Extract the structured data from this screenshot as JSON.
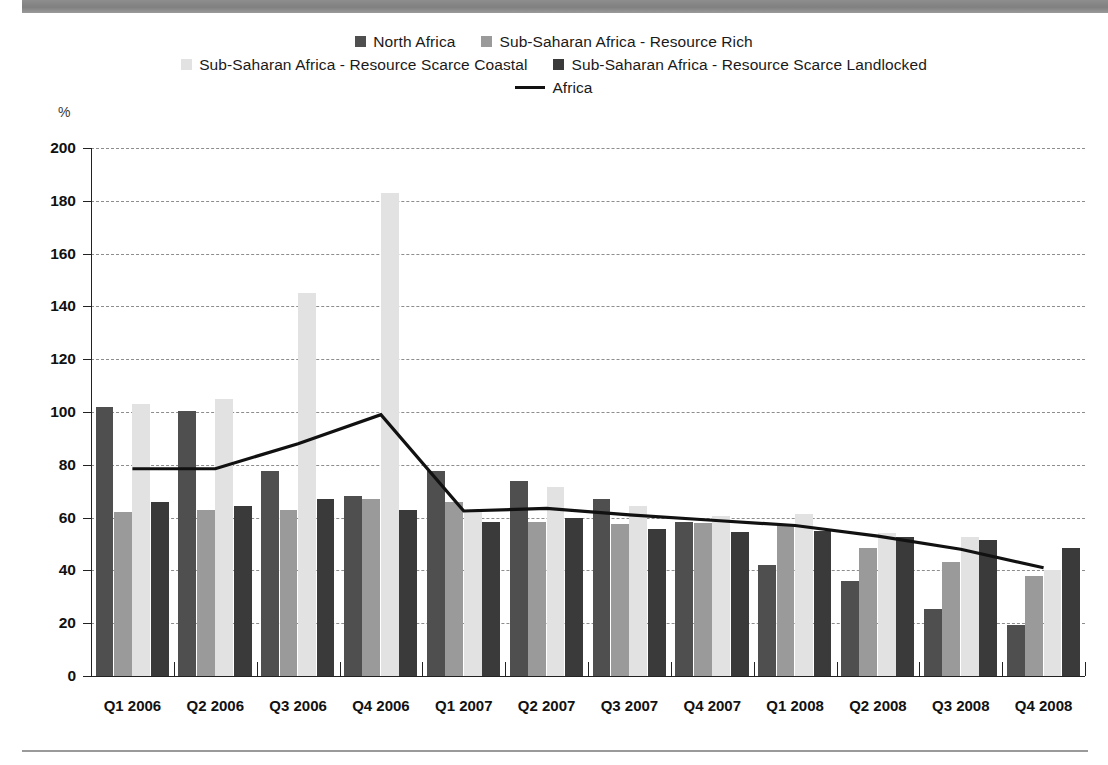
{
  "chart_data": {
    "type": "bar",
    "title": "",
    "subtitle": "",
    "xlabel": "",
    "ylabel": "%",
    "ylim": [
      0,
      200
    ],
    "ytick_step": 20,
    "yticks": [
      0,
      20,
      40,
      60,
      80,
      100,
      120,
      140,
      160,
      180,
      200
    ],
    "grid": true,
    "legend_position": "top",
    "categories": [
      "Q1 2006",
      "Q2 2006",
      "Q3 2006",
      "Q4 2006",
      "Q1 2007",
      "Q2 2007",
      "Q3 2007",
      "Q4 2007",
      "Q1 2008",
      "Q2 2008",
      "Q3 2008",
      "Q4 2008"
    ],
    "series": [
      {
        "name": "North Africa",
        "kind": "bar",
        "color": "#4f4f4f",
        "values": [
          102,
          100.5,
          77.5,
          68,
          77.5,
          74,
          67,
          58.5,
          42,
          36,
          25.5,
          19.5
        ]
      },
      {
        "name": "Sub-Saharan Africa - Resource Rich",
        "kind": "bar",
        "color": "#9a9a9a",
        "values": [
          62,
          63,
          63,
          67,
          66,
          58.5,
          57.5,
          58,
          57.5,
          48.5,
          43,
          38
        ]
      },
      {
        "name": "Sub-Saharan Africa - Resource Scarce Coastal",
        "kind": "bar",
        "color": "#e2e2e2",
        "values": [
          103,
          105,
          145,
          183,
          63,
          71.5,
          64.5,
          60.5,
          61.5,
          54,
          52.5,
          40
        ]
      },
      {
        "name": "Sub-Saharan Africa - Resource Scarce Landlocked",
        "kind": "bar",
        "color": "#3a3a3a",
        "values": [
          66,
          64.5,
          67,
          63,
          58.5,
          60,
          55.5,
          54.5,
          55,
          52.5,
          51.5,
          48.5
        ]
      },
      {
        "name": "Africa",
        "kind": "line",
        "color": "#111111",
        "values": [
          78.5,
          78.5,
          88,
          99,
          62.5,
          63.5,
          61,
          59,
          57,
          53,
          48,
          41
        ]
      }
    ]
  },
  "legend": {
    "rows": [
      [
        {
          "label": "North Africa",
          "marker": "swatch",
          "color": "#4f4f4f"
        },
        {
          "label": "Sub-Saharan Africa - Resource Rich",
          "marker": "swatch",
          "color": "#9a9a9a"
        }
      ],
      [
        {
          "label": "Sub-Saharan Africa - Resource Scarce Coastal",
          "marker": "swatch",
          "color": "#e2e2e2"
        },
        {
          "label": "Sub-Saharan Africa - Resource Scarce Landlocked",
          "marker": "swatch",
          "color": "#3a3a3a"
        }
      ],
      [
        {
          "label": "Africa",
          "marker": "line",
          "color": "#111111"
        }
      ]
    ]
  },
  "axis": {
    "unit": "%"
  }
}
